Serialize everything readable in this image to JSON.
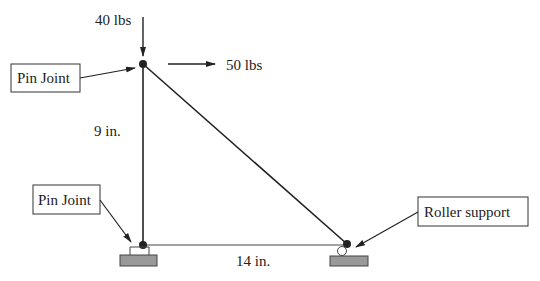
{
  "diagram": {
    "type": "truss",
    "loads": {
      "vertical": "40 lbs",
      "horizontal": "50 lbs"
    },
    "dimensions": {
      "height": "9 in.",
      "width": "14 in."
    },
    "callouts": {
      "top_joint": "Pin Joint",
      "bottom_left_joint": "Pin Joint",
      "bottom_right_joint": "Roller support"
    },
    "colors": {
      "line": "#222222",
      "ground": "#999999"
    }
  }
}
